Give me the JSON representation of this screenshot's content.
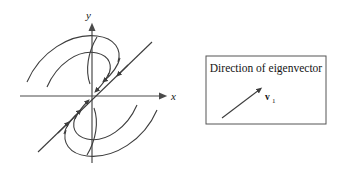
{
  "figure": {
    "type": "phase-portrait",
    "background_color": "#ffffff",
    "stroke_color": "#3d3d3d",
    "axis_color": "#4a4a4a",
    "text_color": "#141414"
  },
  "axes": {
    "x_label": "x",
    "y_label": "y",
    "origin": {
      "x": 92,
      "y": 96
    },
    "x_start": {
      "x": 20,
      "y": 96
    },
    "x_end": {
      "x": 166,
      "y": 96
    },
    "y_start": {
      "x": 92,
      "y": 163
    },
    "y_end": {
      "x": 92,
      "y": 24
    }
  },
  "eigenvector_line": {
    "label": "v1",
    "from": {
      "x": 38,
      "y": 152
    },
    "to": {
      "x": 152,
      "y": 42
    },
    "slope_note": "passes through origin at roughly 45 degrees"
  },
  "legend": {
    "title": "Direction of eigenvector",
    "vector_label_main": "v",
    "vector_label_sub": "1",
    "box": {
      "x": 206,
      "y": 56,
      "width": 120,
      "height": 68
    },
    "arrow_from": {
      "x": 222,
      "y": 118
    },
    "arrow_to": {
      "x": 261,
      "y": 89
    }
  },
  "trajectories": [
    {
      "name": "outer-upper-left",
      "quadrant": "upper-left"
    },
    {
      "name": "inner-upper-left",
      "quadrant": "upper-left"
    },
    {
      "name": "hook-upper",
      "quadrant": "upper-center"
    },
    {
      "name": "outer-lower-right",
      "quadrant": "lower-right"
    },
    {
      "name": "inner-lower-right",
      "quadrant": "lower-right"
    },
    {
      "name": "hook-lower",
      "quadrant": "lower-center"
    }
  ]
}
